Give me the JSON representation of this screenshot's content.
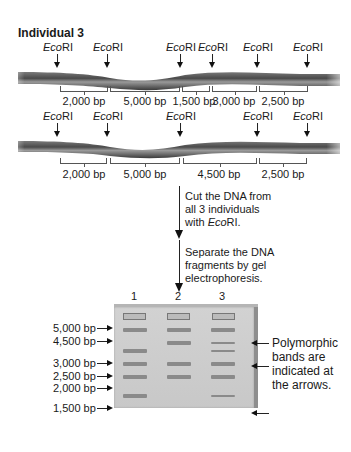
{
  "title": "Individual 3",
  "enzyme": {
    "italic": "Eco",
    "roman": "RI"
  },
  "strand_top": {
    "sites_x": [
      58,
      108,
      181,
      211,
      258,
      308
    ],
    "fragments": [
      {
        "label": "2,000 bp",
        "x1": 60,
        "x2": 107
      },
      {
        "label": "5,000 bp",
        "x1": 110,
        "x2": 179
      },
      {
        "label": "1,500 bp",
        "x1": 183,
        "x2": 208
      },
      {
        "label": "3,000 bp",
        "x1": 212,
        "x2": 255
      },
      {
        "label": "2,500 bp",
        "x1": 259,
        "x2": 306
      }
    ]
  },
  "strand_bottom": {
    "sites_x": [
      58,
      108,
      181,
      258,
      308
    ],
    "fragments": [
      {
        "label": "2,000 bp",
        "x1": 60,
        "x2": 105
      },
      {
        "label": "5,000 bp",
        "x1": 110,
        "x2": 179
      },
      {
        "label": "4,500 bp",
        "x1": 183,
        "x2": 255
      },
      {
        "label": "2,500 bp",
        "x1": 259,
        "x2": 305
      }
    ]
  },
  "steps": [
    {
      "text_lines": [
        "Cut the DNA from",
        "all 3 individuals",
        "with "
      ],
      "enzyme_suffix": true
    },
    {
      "text_lines": [
        "Separate the DNA",
        "fragments by gel",
        "electrophoresis."
      ]
    }
  ],
  "step1": {
    "line1": "Cut the DNA from",
    "line2": "all 3 individuals",
    "line3_prefix": "with ",
    "line3_suffix": "."
  },
  "step2": {
    "line1": "Separate the DNA",
    "line2": "fragments by gel",
    "line3": "electrophoresis."
  },
  "gel": {
    "lanes": [
      "1",
      "2",
      "3"
    ],
    "ladder": [
      "5,000 bp",
      "4,500 bp",
      "3,000 bp",
      "2,500 bp",
      "2,000 bp",
      "1,500 bp"
    ],
    "bands": {
      "lane1": [
        "5,000 bp",
        "3,000 bp",
        "2,500 bp",
        "2,000 bp",
        "1,500 bp"
      ],
      "lane2": [
        "5,000 bp",
        "4,500 bp",
        "2,500 bp",
        "2,000 bp"
      ],
      "lane3": [
        "5,000 bp",
        "4,500 bp",
        "3,000 bp",
        "2,500 bp",
        "2,000 bp",
        "1,500 bp"
      ]
    },
    "polymorphic_note": [
      "Polymorphic",
      "bands are",
      "indicated at",
      "the arrows."
    ],
    "polymorphic_bands": [
      "4,500 bp",
      "3,000 bp",
      "1,500 bp"
    ]
  },
  "colors": {
    "dna": "#5a5a5a",
    "gel": "#cccccc",
    "band": "#8a8a8a"
  }
}
